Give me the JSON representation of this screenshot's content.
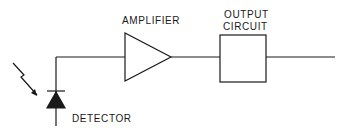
{
  "diagram": {
    "type": "block-diagram",
    "title": "",
    "nodes": [
      {
        "id": "detector",
        "label": "DETECTOR",
        "shape": "photodiode"
      },
      {
        "id": "amplifier",
        "label": "AMPLIFIER",
        "shape": "triangle"
      },
      {
        "id": "output",
        "label_lines": [
          "OUTPUT",
          "CIRCUIT"
        ],
        "shape": "rectangle"
      }
    ],
    "edges": [
      {
        "from": "detector",
        "to": "amplifier"
      },
      {
        "from": "amplifier",
        "to": "output"
      },
      {
        "from": "output",
        "to": "out-line"
      }
    ],
    "input_indicator": "incident-light-arrow"
  },
  "labels": {
    "amplifier": "AMPLIFIER",
    "output_line1": "OUTPUT",
    "output_line2": "CIRCUIT",
    "detector": "DETECTOR"
  },
  "colors": {
    "stroke": "#1a1a1a",
    "background": "#ffffff"
  }
}
